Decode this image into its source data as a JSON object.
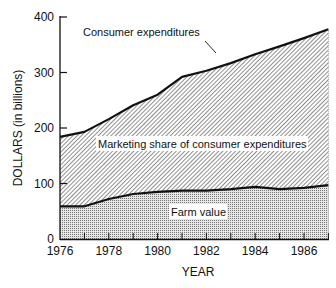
{
  "chart_data": {
    "type": "area",
    "title": "",
    "xlabel": "YEAR",
    "ylabel": "DOLLARS (in billions)",
    "xlim": [
      1976,
      1987
    ],
    "ylim": [
      0,
      400
    ],
    "grid": false,
    "x": [
      1976,
      1977,
      1978,
      1979,
      1980,
      1981,
      1982,
      1983,
      1984,
      1985,
      1986,
      1987
    ],
    "x_tick_labels": [
      "1976",
      "1978",
      "1980",
      "1982",
      "1984",
      "1986"
    ],
    "y_tick_labels": [
      "0",
      "100",
      "200",
      "300",
      "400"
    ],
    "series": [
      {
        "name": "Consumer expenditures",
        "values": [
          184,
          193,
          216,
          241,
          260,
          292,
          303,
          317,
          333,
          347,
          362,
          378
        ]
      },
      {
        "name": "Farm value",
        "values": [
          59,
          59,
          72,
          81,
          85,
          87,
          87,
          90,
          94,
          90,
          92,
          97
        ]
      }
    ],
    "area_labels": [
      {
        "name": "Marketing share of consumer expenditures",
        "region": "between farm value and consumer expenditures",
        "fill": "diagonal hatch"
      },
      {
        "name": "Farm value",
        "region": "below farm value line",
        "fill": "dotted stipple"
      }
    ],
    "annotations": [
      {
        "text": "Consumer expenditures",
        "leader_line_to_year": 1982.6
      }
    ]
  },
  "labels": {
    "consumer": "Consumer expenditures",
    "marketing": "Marketing share of consumer expenditures",
    "farm": "Farm value",
    "xlabel": "YEAR",
    "ylabel": "DOLLARS (in billions)"
  }
}
